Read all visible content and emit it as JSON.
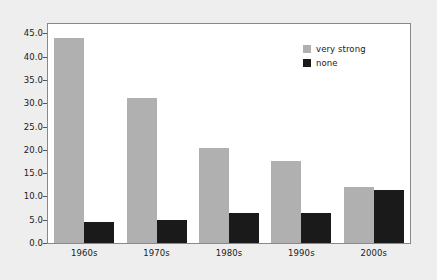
{
  "chart_data": {
    "type": "bar",
    "title": "",
    "subtitle": "",
    "xlabel": "",
    "ylabel": "",
    "categories": [
      "1960s",
      "1970s",
      "1980s",
      "1990s",
      "2000s"
    ],
    "series": [
      {
        "name": "very strong",
        "color": "#b0b0b0",
        "values": [
          43.9,
          31.1,
          20.4,
          17.6,
          12.0
        ]
      },
      {
        "name": "none",
        "color": "#1a1a1a",
        "values": [
          4.5,
          4.9,
          6.4,
          6.4,
          11.3
        ]
      }
    ],
    "ylim": [
      0.0,
      47.0
    ],
    "yticks": [
      "0.0",
      "5.0",
      "10.0",
      "15.0",
      "20.0",
      "25.0",
      "30.0",
      "35.0",
      "40.0",
      "45.0"
    ],
    "ytick_values": [
      0.0,
      5.0,
      10.0,
      15.0,
      20.0,
      25.0,
      30.0,
      35.0,
      40.0,
      45.0
    ],
    "grid": false,
    "legend_position": "top-right",
    "plot_background": "#ffffff",
    "figure_background": "#eeeeee",
    "frame_color": "#888888"
  }
}
